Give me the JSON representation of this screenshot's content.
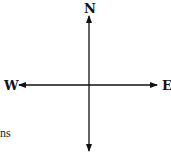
{
  "diagram": {
    "type": "compass",
    "labels": {
      "north": "N",
      "west": "W",
      "east": "E"
    },
    "fragment_text": "ns",
    "colors": {
      "stroke": "#111111",
      "background": "#ffffff"
    }
  }
}
